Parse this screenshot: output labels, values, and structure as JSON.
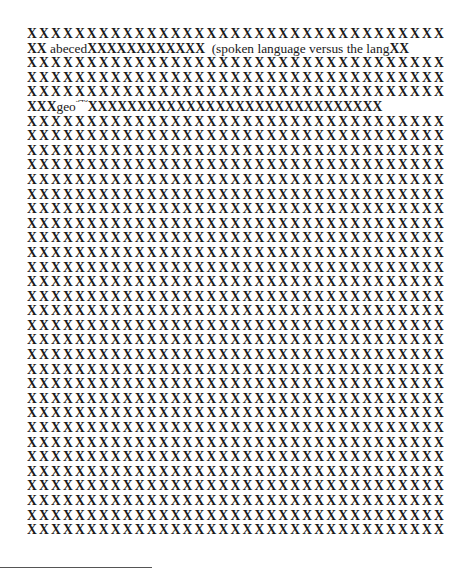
{
  "document": {
    "mask_char": "X",
    "chars_per_full_line": 35,
    "total_lines": 35,
    "lines": [
      {
        "type": "full"
      },
      {
        "type": "mixed",
        "segments": [
          {
            "kind": "mask",
            "text": "XX"
          },
          {
            "kind": "word",
            "text": " abeced"
          },
          {
            "kind": "mask",
            "text": "XXXXXXXXXXXX"
          },
          {
            "kind": "word",
            "text": "  (spoken language versus the lang"
          },
          {
            "kind": "mask",
            "text": "XX"
          }
        ]
      },
      {
        "type": "full"
      },
      {
        "type": "full"
      },
      {
        "type": "full"
      },
      {
        "type": "mixed",
        "segments": [
          {
            "kind": "mask",
            "text": "XXX"
          },
          {
            "kind": "word",
            "text": "geo"
          },
          {
            "kind": "sup",
            "text": "346"
          },
          {
            "kind": "mask",
            "text": "XXXXXXXXXXXXXXXXXXXXXXXXXXXXXX"
          }
        ]
      }
    ],
    "visible_fragments": {
      "fragment_1": "abeced",
      "fragment_2": "(spoken language versus the lang",
      "fragment_3": "geo",
      "footnote_marker": "346"
    }
  }
}
